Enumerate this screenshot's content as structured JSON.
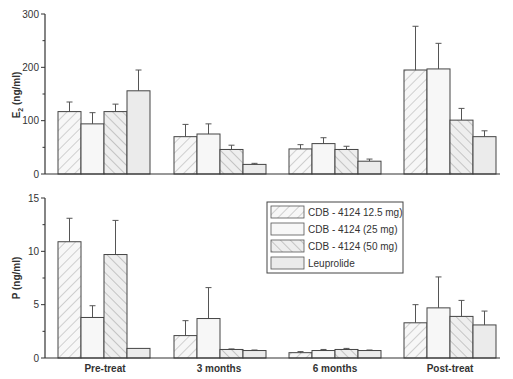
{
  "chart_data": [
    {
      "type": "bar",
      "panel": "top",
      "title": "",
      "xlabel": "",
      "ylabel": "E2 (ng/ml)",
      "ylabel_main": "E",
      "ylabel_sub": "2",
      "ylabel_rest": " (ng/ml)",
      "ylim": [
        0,
        300
      ],
      "yticks": [
        0,
        100,
        200,
        300
      ],
      "yminor": [
        50,
        150,
        250
      ],
      "grid": false,
      "categories": [
        "Pre-treat",
        "3 months",
        "6 months",
        "Post-treat"
      ],
      "series": [
        {
          "name": "CDB - 4124  12.5 mg)",
          "values": [
            117,
            70,
            47,
            195
          ],
          "errors": [
            18,
            23,
            8,
            82
          ]
        },
        {
          "name": "CDB - 4124  (25 mg)",
          "values": [
            94,
            75,
            57,
            197
          ],
          "errors": [
            21,
            19,
            11,
            48
          ]
        },
        {
          "name": "CDB - 4124  (50 mg)",
          "values": [
            117,
            46,
            46,
            101
          ],
          "errors": [
            14,
            8,
            6,
            22
          ]
        },
        {
          "name": "Leuprolide",
          "values": [
            156,
            18,
            24,
            70
          ],
          "errors": [
            39,
            2,
            4,
            11
          ]
        }
      ]
    },
    {
      "type": "bar",
      "panel": "bottom",
      "title": "",
      "xlabel": "",
      "ylabel": "P (ng/ml)",
      "ylim": [
        0,
        15
      ],
      "yticks": [
        0,
        5,
        10,
        15
      ],
      "yminor": [
        2.5,
        7.5,
        12.5
      ],
      "grid": false,
      "categories": [
        "Pre-treat",
        "3 months",
        "6 months",
        "Post-treat"
      ],
      "series": [
        {
          "name": "CDB - 4124  12.5 mg)",
          "values": [
            10.9,
            2.1,
            0.5,
            3.3
          ],
          "errors": [
            2.2,
            1.4,
            0.1,
            1.7
          ]
        },
        {
          "name": "CDB - 4124  (25 mg)",
          "values": [
            3.8,
            3.7,
            0.7,
            4.7
          ],
          "errors": [
            1.1,
            2.9,
            0.1,
            2.9
          ]
        },
        {
          "name": "CDB - 4124  (50 mg)",
          "values": [
            9.7,
            0.8,
            0.8,
            3.9
          ],
          "errors": [
            3.2,
            0.05,
            0.1,
            1.5
          ]
        },
        {
          "name": "Leuprolide",
          "values": [
            0.9,
            0.7,
            0.7,
            3.1
          ],
          "errors": [
            0,
            0.05,
            0.05,
            1.3
          ]
        }
      ]
    }
  ],
  "legend": {
    "position": "inside bottom panel, upper middle-right",
    "items": [
      {
        "label": "CDB - 4124  12.5 mg)",
        "pattern": "hatch-forward"
      },
      {
        "label": "CDB - 4124  (25 mg)",
        "pattern": "plain"
      },
      {
        "label": "CDB - 4124  (50 mg)",
        "pattern": "hatch-back"
      },
      {
        "label": "Leuprolide",
        "pattern": "plain-grey"
      }
    ]
  },
  "colors": {
    "axis": "#333333",
    "bar_fill_light": "#f7f7f7",
    "bar_fill_grey": "#ebebeb",
    "bar_stroke": "#444444",
    "hatch": "#b5b5b5"
  }
}
